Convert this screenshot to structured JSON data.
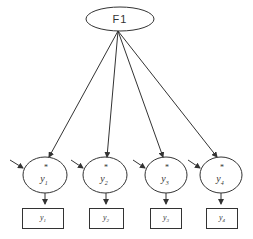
{
  "diagram": {
    "factor": {
      "label": "F1",
      "cx": 120,
      "cy": 19,
      "rx": 34,
      "ry": 12
    },
    "latents": [
      {
        "base": "y",
        "sub": "1",
        "star": "*",
        "cx": 45,
        "cy": 175
      },
      {
        "base": "y",
        "sub": "2",
        "star": "*",
        "cx": 105,
        "cy": 175
      },
      {
        "base": "y",
        "sub": "3",
        "star": "*",
        "cx": 166,
        "cy": 175
      },
      {
        "base": "y",
        "sub": "4",
        "star": "*",
        "cx": 221,
        "cy": 175
      }
    ],
    "observed": [
      {
        "base": "y",
        "sub": "1",
        "x": 22,
        "y": 208,
        "w": 41,
        "h": 20
      },
      {
        "base": "y",
        "sub": "2",
        "x": 89,
        "y": 208,
        "w": 34,
        "h": 20
      },
      {
        "base": "y",
        "sub": "3",
        "x": 150,
        "y": 208,
        "w": 31,
        "h": 20
      },
      {
        "base": "y",
        "sub": "4",
        "x": 206,
        "y": 208,
        "w": 31,
        "h": 20
      }
    ],
    "colors": {
      "stroke": "#333333",
      "background": "#ffffff"
    }
  }
}
